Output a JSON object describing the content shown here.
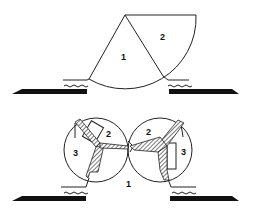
{
  "figure": {
    "top_panel": {
      "labels": {
        "region1": "1",
        "region2": "2"
      }
    },
    "bottom_panel": {
      "labels": {
        "left_region2": "2",
        "left_region3": "3",
        "right_region2": "2",
        "right_region3": "3",
        "center_region1": "1"
      }
    },
    "colors": {
      "stroke": "#222222",
      "fill_dark": "#111111",
      "background": "#ffffff"
    }
  }
}
